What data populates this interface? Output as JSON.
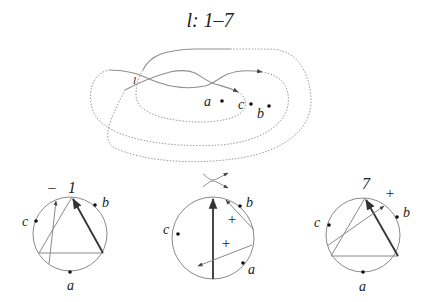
{
  "title": "l: 1–7",
  "knot_diagram": {
    "points": [
      {
        "label": "a"
      },
      {
        "label": "c"
      },
      {
        "label": "b"
      }
    ],
    "crossing_label": "l"
  },
  "chord_diagrams": [
    {
      "name": "left",
      "top_label": "1",
      "sign": "–",
      "points": {
        "a": "a",
        "b": "b",
        "c": "c"
      }
    },
    {
      "name": "middle",
      "top_label": "",
      "crossing_symbol": "smoothing-cross",
      "signs": [
        "+",
        "+"
      ],
      "points": {
        "a": "a",
        "b": "b",
        "c": "c"
      }
    },
    {
      "name": "right",
      "top_label": "7",
      "sign": "+",
      "points": {
        "a": "a",
        "b": "b",
        "c": "c"
      }
    }
  ]
}
